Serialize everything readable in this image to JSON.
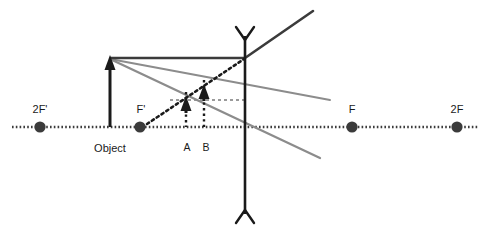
{
  "figure": {
    "type": "optics-ray-diagram",
    "title": "",
    "background_color": "#ffffff"
  },
  "colors": {
    "principal_axis": "#3b3b3b",
    "object_arrow": "#1a1a1a",
    "lens": "#1a1a1a",
    "ray_solid_dark": "#3b3b3b",
    "ray_solid_gray": "#8c8c8c",
    "ray_dotted_dark": "#1a1a1a",
    "construction_dotted": "#9a9a9a",
    "point_dot": "#3b3b3b",
    "label_text": "#1a1a1a"
  },
  "axis": {
    "name": "principal-axis",
    "y": 127,
    "x_start": 12,
    "x_end": 478,
    "style": "dotted"
  },
  "lens": {
    "name": "converging-lens",
    "x": 245,
    "y_top": 36,
    "y_bottom": 214,
    "arrowhead_style": "double-outward-v"
  },
  "points": [
    {
      "id": "2Fp",
      "label": "2F'",
      "x": 40,
      "y": 127,
      "label_x": 40,
      "label_y": 112,
      "dot": true
    },
    {
      "id": "Fp",
      "label": "F'",
      "x": 140,
      "y": 127,
      "label_x": 141,
      "label_y": 112,
      "dot": true
    },
    {
      "id": "F",
      "label": "F",
      "x": 352,
      "y": 127,
      "label_x": 352,
      "label_y": 112,
      "dot": true
    },
    {
      "id": "2F",
      "label": "2F",
      "x": 457,
      "y": 127,
      "label_x": 457,
      "label_y": 112,
      "dot": true
    }
  ],
  "object": {
    "name": "object-arrow",
    "label": "Object",
    "x": 110,
    "base_y": 127,
    "tip_y": 58,
    "label_x": 110,
    "label_y": 148
  },
  "images": [
    {
      "id": "A",
      "label": "A",
      "x": 186,
      "base_y": 127,
      "tip_y": 100,
      "label_x": 186,
      "label_y": 148
    },
    {
      "id": "B",
      "label": "B",
      "x": 204,
      "base_y": 127,
      "tip_y": 88,
      "label_x": 204,
      "label_y": 148
    }
  ],
  "rays": [
    {
      "id": "parallel-incident",
      "style": "solid",
      "color": "ray_solid_dark",
      "width": 2.2,
      "points": "110,58 245,58"
    },
    {
      "id": "refracted-upward",
      "style": "solid",
      "color": "ray_solid_dark",
      "width": 2.2,
      "points": "245,58 312,12"
    },
    {
      "id": "dotted-virtual-extension",
      "style": "dotted",
      "color": "ray_dotted_dark",
      "width": 2.4,
      "points": "146,124 245,58"
    },
    {
      "id": "object-to-lens-gray-upper",
      "style": "solid",
      "color": "ray_solid_gray",
      "width": 2.0,
      "points": "110,59 330,100"
    },
    {
      "id": "object-to-lens-gray-lower",
      "style": "solid",
      "color": "ray_solid_gray",
      "width": 2.2,
      "points": "110,59 320,158"
    },
    {
      "id": "image-height-construction",
      "style": "dotted",
      "color": "construction_dotted",
      "width": 1.8,
      "points": "170,100 245,100"
    }
  ],
  "drop_lines": [
    {
      "id": "drop-A",
      "x": 186,
      "y_top": 92,
      "y_bottom": 127,
      "style": "dotted"
    },
    {
      "id": "drop-B",
      "x": 204,
      "y_top": 80,
      "y_bottom": 127,
      "style": "dotted"
    }
  ],
  "labels": {
    "object": "Object",
    "point_a": "A",
    "point_b": "B",
    "two_f_prime": "2F'",
    "f_prime": "F'",
    "f": "F",
    "two_f": "2F"
  }
}
